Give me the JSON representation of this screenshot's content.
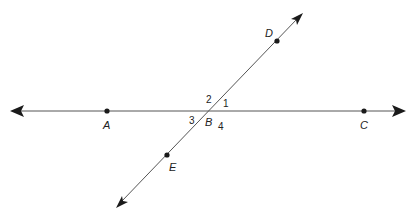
{
  "diagram": {
    "type": "intersecting-lines",
    "colors": {
      "line": "#555555",
      "point": "#1a1a1a",
      "text": "#222222"
    },
    "lines": [
      {
        "name": "line-AC",
        "from": [
          12,
          111
        ],
        "to": [
          404,
          111
        ],
        "arrows": "both"
      },
      {
        "name": "line-DE",
        "from": [
          117,
          207
        ],
        "to": [
          302,
          14
        ],
        "arrows": "both"
      }
    ],
    "points": [
      {
        "label": "A",
        "x": 107,
        "y": 111
      },
      {
        "label": "C",
        "x": 364,
        "y": 111
      },
      {
        "label": "D",
        "x": 277,
        "y": 41
      },
      {
        "label": "E",
        "x": 167,
        "y": 155
      },
      {
        "label": "B",
        "x": 209,
        "y": 111,
        "intersection": true
      }
    ],
    "labels": {
      "A": "A",
      "B": "B",
      "C": "C",
      "D": "D",
      "E": "E"
    },
    "angles": {
      "a1": "1",
      "a2": "2",
      "a3": "3",
      "a4": "4"
    }
  }
}
